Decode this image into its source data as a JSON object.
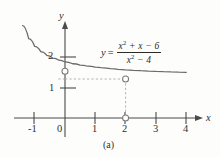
{
  "figure": {
    "panel_label": "(a)",
    "axes": {
      "x_axis_name": "x",
      "y_axis_name": "y",
      "x_ticks": [
        "-1",
        "0",
        "1",
        "2",
        "3",
        "4"
      ],
      "y_ticks": [
        "1",
        "2"
      ]
    },
    "equation": {
      "lhs": "y",
      "equals": "=",
      "numerator_a": "x",
      "numerator_exp": "2",
      "numerator_b": " + x − 6",
      "denominator_a": "x",
      "denominator_exp": "2",
      "denominator_b": " − 4"
    },
    "colors": {
      "curve": "#6b6b6b",
      "axis": "#4a4a4a",
      "guide": "#a9a9a9",
      "text": "#2f2f2f",
      "background": "#fdfdfc"
    }
  },
  "chart_data": {
    "type": "line",
    "title": "",
    "xlabel": "x",
    "ylabel": "y",
    "xlim": [
      -1.45,
      4.35
    ],
    "ylim": [
      -0.45,
      3.1
    ],
    "grid": false,
    "legend": null,
    "annotations": [
      {
        "text": "y = (x^2 + x - 6)/(x^2 - 4)",
        "x": 1.2,
        "y": 2.55
      }
    ],
    "series": [
      {
        "name": "y = (x^2 + x - 6)/(x^2 - 4)",
        "expression": "(x^2 + x - 6)/(x^2 - 4)",
        "simplified": "(x + 3)/(x + 2)",
        "x": [
          -1.4,
          -1.2,
          -1.0,
          -0.8,
          -0.6,
          -0.4,
          -0.2,
          0.0,
          0.25,
          0.5,
          0.75,
          1.0,
          1.25,
          1.5,
          1.75,
          2.0,
          2.25,
          2.5,
          2.75,
          3.0,
          3.25,
          3.5,
          3.75,
          4.0
        ],
        "y": [
          2.667,
          2.25,
          2.0,
          1.833,
          1.714,
          1.625,
          1.556,
          1.5,
          1.444,
          1.4,
          1.364,
          1.333,
          1.308,
          1.286,
          1.267,
          1.25,
          1.235,
          1.222,
          1.211,
          1.2,
          1.19,
          1.182,
          1.174,
          1.167
        ]
      }
    ],
    "holes": [
      {
        "x": 0.0,
        "y": 1.5,
        "label": "removable-point-x0"
      },
      {
        "x": 2.0,
        "y": 1.25,
        "label": "removable-discontinuity-x2"
      }
    ],
    "axis_markers": [
      {
        "x": 2.0,
        "y": 0.0,
        "label": "x-axis-open-point-x2"
      }
    ],
    "guides": [
      {
        "type": "horizontal",
        "from": [
          0.0,
          1.25
        ],
        "to": [
          2.0,
          1.25
        ]
      },
      {
        "type": "vertical",
        "from": [
          2.0,
          1.25
        ],
        "to": [
          2.0,
          0.0
        ]
      },
      {
        "type": "horizontal-tick",
        "from": [
          0.0,
          1.25
        ],
        "to": [
          -0.25,
          1.25
        ]
      }
    ]
  }
}
